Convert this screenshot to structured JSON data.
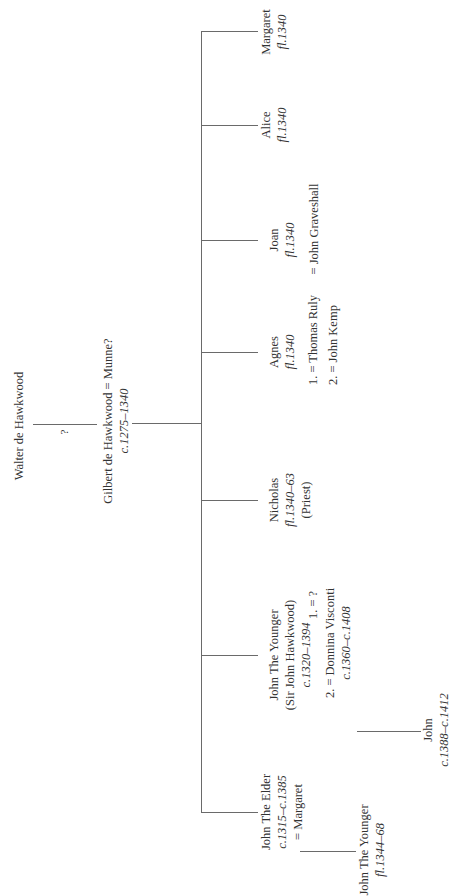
{
  "tree": {
    "root": {
      "name": "Walter de Hawkwood",
      "link_label": "?"
    },
    "parent": {
      "name": "Gilbert de Hawkwood = Munne?",
      "dates": "c.1275–1340"
    },
    "children": [
      {
        "name": "John The Elder",
        "dates": "c.1315–c.1385",
        "spouse": "= Margaret",
        "child": {
          "name": "John The Younger",
          "dates": "fl.1344–68"
        }
      },
      {
        "name": "John The Younger",
        "alias": "(Sir John Hawkwood)",
        "dates": "c.1320–1394",
        "marriages": [
          "1. = ?",
          "2. = Donnina Visconti"
        ],
        "spouse2_dates": "c.1360–c.1408",
        "child": {
          "name": "John",
          "dates": "c.1388–c.1412"
        }
      },
      {
        "name": "Nicholas",
        "dates": "fl.1340–63",
        "note": "(Priest)"
      },
      {
        "name": "Agnes",
        "dates": "fl.1340",
        "marriages": [
          "1. = Thomas Ruly",
          "2. = John Kemp"
        ]
      },
      {
        "name": "Joan",
        "dates": "fl.1340",
        "spouse": "= John Graveshall"
      },
      {
        "name": "Alice",
        "dates": "fl.1340"
      },
      {
        "name": "Margaret",
        "dates": "fl.1340"
      }
    ]
  },
  "colors": {
    "line": "#6a6a6a",
    "text": "#333333",
    "background": "#ffffff"
  }
}
